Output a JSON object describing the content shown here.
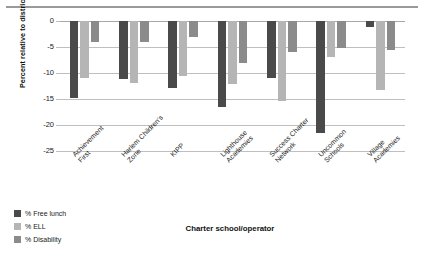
{
  "chart_data": {
    "type": "bar",
    "title": "",
    "subtitle": "",
    "xlabel": "Charter school/operator",
    "ylabel": "Percent relative to district",
    "categories": [
      "Achievement First",
      "Harlem Children's Zone",
      "KIPP",
      "Lighthouse Academies",
      "Success Charter Network",
      "Uncommon Schools",
      "Village Academies"
    ],
    "series": [
      {
        "name": "% Free lunch",
        "color": "#4a4a4a",
        "values": [
          -14.8,
          -11.2,
          -12.8,
          -16.5,
          -11.0,
          -21.5,
          -1.2
        ]
      },
      {
        "name": "% ELL",
        "color": "#b5b5b5",
        "values": [
          -11.0,
          -12.0,
          -10.6,
          -12.2,
          -15.3,
          -7.0,
          -13.2
        ]
      },
      {
        "name": "% Disability",
        "color": "#8b8b8b",
        "values": [
          -4.0,
          -4.1,
          -3.1,
          -8.0,
          -6.0,
          -5.2,
          -5.6
        ]
      }
    ],
    "ylim": [
      -25,
      0
    ],
    "yticks": [
      0,
      -5,
      -10,
      -15,
      -20,
      -25
    ],
    "ytick_labels": [
      "0",
      "-5",
      "-10",
      "-15",
      "-20",
      "-25"
    ],
    "grid": true,
    "legend_position": "bottom-left",
    "orientation": "vertical"
  },
  "legend": {
    "items": [
      {
        "label": "% Free lunch",
        "color": "#4a4a4a"
      },
      {
        "label": "% ELL",
        "color": "#b5b5b5"
      },
      {
        "label": "% Disability",
        "color": "#8b8b8b"
      }
    ]
  }
}
